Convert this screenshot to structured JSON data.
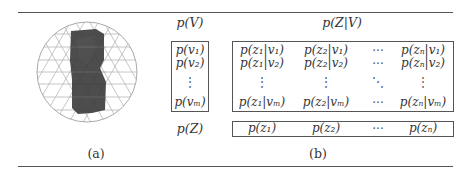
{
  "figure": {
    "panel_a": {
      "caption": "(a)",
      "image": "sphere-with-3d-object-icon"
    },
    "panel_b": {
      "caption": "(b)",
      "label_pv": "p(V)",
      "label_pzv": "p(Z|V)",
      "label_pz": "p(Z)",
      "pv_column": [
        "p(v₁)",
        "p(v₂)",
        "⋮",
        "p(vₘ)"
      ],
      "pzv_matrix": {
        "rows": [
          [
            "p(z₁|v₁)",
            "p(z₂|v₁)",
            "···",
            "p(zₙ|v₁)"
          ],
          [
            "p(z₁|v₂)",
            "p(z₂|v₂)",
            "···",
            "p(zₙ|v₂)"
          ],
          [
            "⋮",
            "⋮",
            "⋱",
            "⋮"
          ],
          [
            "p(z₁|vₘ)",
            "p(z₂|vₘ)",
            "···",
            "p(zₙ|vₘ)"
          ]
        ]
      },
      "pz_row": [
        "p(z₁)",
        "p(z₂)",
        "···",
        "p(zₙ)"
      ]
    }
  }
}
